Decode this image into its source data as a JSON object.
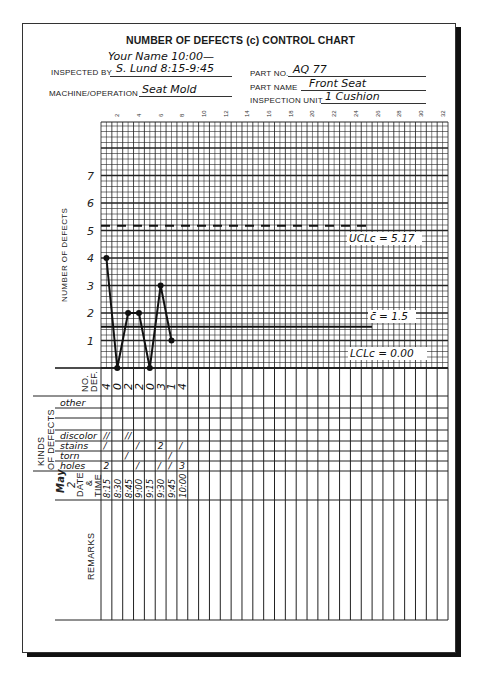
{
  "form": {
    "title": "NUMBER OF DEFECTS (c) CONTROL CHART",
    "inspected_by_label": "INSPECTED BY",
    "inspected_by_value": "S. Lund 8:15-9:45",
    "inspected_by_extra": "Your Name 10:00—",
    "machine_label": "MACHINE/OPERATION",
    "machine_value": "Seat Mold",
    "part_no_label": "PART NO.",
    "part_no_value": "AQ 77",
    "part_name_label": "PART NAME",
    "part_name_value": "Front Seat",
    "inspection_unit_label": "INSPECTION UNIT",
    "inspection_unit_value": "1 Cushion"
  },
  "labels": {
    "y_axis": "NUMBER OF DEFECTS",
    "no_def_1": "NO.",
    "no_def_2": "DEF.",
    "kinds_1": "KINDS",
    "kinds_2": "OF DEFECTS",
    "date_month": "May",
    "date_day": "2",
    "date_label": "DATE",
    "amp": "&",
    "time_label": "TIME",
    "remarks": "REMARKS",
    "ucl": "UCLc = 5.17",
    "cbar": "c̄ = 1.5",
    "lcl": "LCLc = 0.00"
  },
  "kinds": [
    "other",
    "",
    "",
    "discolor",
    "stains",
    "torn",
    "holes"
  ],
  "tallies": [
    {
      "kind": "discolor",
      "marks": [
        "//",
        "",
        "//",
        "",
        "",
        "",
        "",
        ""
      ]
    },
    {
      "kind": "stains",
      "marks": [
        "/",
        "",
        "",
        "/",
        "",
        "2",
        "",
        "/"
      ]
    },
    {
      "kind": "torn",
      "marks": [
        "",
        "",
        "/",
        "",
        "",
        "",
        "/",
        ""
      ]
    },
    {
      "kind": "holes",
      "marks": [
        "2",
        "",
        "",
        "/",
        "",
        "/",
        "/",
        "3"
      ]
    }
  ],
  "chart_data": {
    "type": "line",
    "title": "NUMBER OF DEFECTS (c) CONTROL CHART",
    "xlabel": "Sample",
    "ylabel": "NUMBER OF DEFECTS",
    "x": [
      1,
      2,
      3,
      4,
      5,
      6,
      7,
      8
    ],
    "times": [
      "8:15",
      "8:30",
      "8:45",
      "9:00",
      "9:15",
      "9:30",
      "9:45",
      "10:00"
    ],
    "values": [
      4,
      0,
      2,
      2,
      0,
      3,
      1,
      4
    ],
    "plotted_points": 7,
    "x_ticks": [
      2,
      4,
      6,
      8,
      10,
      12,
      14,
      16,
      18,
      20,
      22,
      24,
      26,
      28,
      30,
      32
    ],
    "y_ticks": [
      1,
      2,
      3,
      4,
      5,
      6,
      7
    ],
    "xlim": [
      0,
      32
    ],
    "ylim": [
      0,
      8.8
    ],
    "grid": true,
    "control_lines": [
      {
        "name": "UCLc",
        "value": 5.17,
        "style": "dashed"
      },
      {
        "name": "c-bar",
        "value": 1.5,
        "style": "solid"
      },
      {
        "name": "LCLc",
        "value": 0.0,
        "style": "solid"
      }
    ]
  }
}
